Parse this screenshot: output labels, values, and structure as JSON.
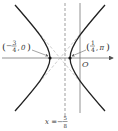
{
  "diagram": {
    "type": "hyperbola-plot",
    "origin_label": "O",
    "left_vertex": {
      "label_num": "3",
      "label_den": "4",
      "label_sign": "−",
      "label_y": "0",
      "text": "(−3/4, 0)"
    },
    "right_vertex": {
      "label_num": "1",
      "label_den": "4",
      "label_y": "π",
      "text": "(1/4, π)"
    },
    "dashed_line": {
      "lhs": "x =",
      "sign": "−",
      "num": "5",
      "den": "8",
      "text": "x = −5/8"
    },
    "colors": {
      "curve": "#222222",
      "axis": "#555555",
      "asymptote": "#999999"
    }
  }
}
